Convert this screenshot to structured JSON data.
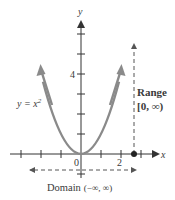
{
  "figure": {
    "axes": {
      "x_label": "x",
      "y_label": "y",
      "x_tick_labels": {
        "origin": "0",
        "two": "2"
      },
      "y_tick_labels": {
        "four": "4"
      }
    },
    "curve": {
      "equation_prefix": "y = x",
      "equation_exponent": "2",
      "color": "#8a8a8a"
    },
    "range": {
      "label": "Range",
      "interval": "[0, ∞)"
    },
    "domain": {
      "label": "Domain",
      "interval": "(−∞, ∞)"
    },
    "colors": {
      "axis": "#333333",
      "text": "#3a3a3a",
      "dashed": "#555555"
    }
  }
}
